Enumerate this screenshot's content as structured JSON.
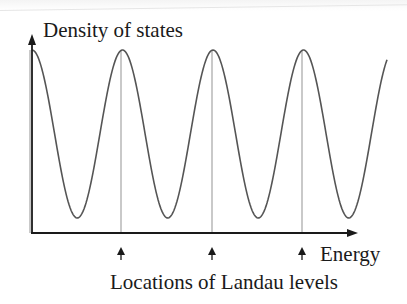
{
  "figure": {
    "y_axis_label": "Density of states",
    "x_axis_label": "Energy",
    "caption": "Locations of Landau levels",
    "markers": [
      {
        "label": "Landau level 1",
        "x": 121
      },
      {
        "label": "Landau level 2",
        "x": 212
      },
      {
        "label": "Landau level 3",
        "x": 302
      }
    ],
    "colors": {
      "curve": "#555555",
      "axes": "#1a1a1a",
      "guide_lines": "#c8c8c8",
      "text": "#1a1a1a"
    }
  },
  "chart_data": {
    "type": "line",
    "title": "",
    "xlabel": "Energy",
    "ylabel": "Density of states",
    "annotation": "Locations of Landau levels",
    "peaks_x_px": [
      32,
      121,
      212,
      302
    ],
    "troughs_x_px": [
      75,
      166,
      257,
      347
    ],
    "series": [
      {
        "name": "Density of states",
        "shape": "cosine",
        "period_px": 90.5,
        "peak_y_px": 50,
        "trough_y_px": 218
      }
    ],
    "grid": false,
    "legend": "none"
  }
}
